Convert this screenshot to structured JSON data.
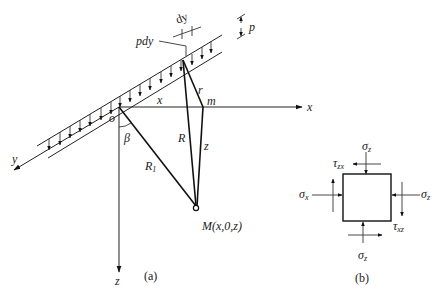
{
  "figure": {
    "panel_a": {
      "caption": "(a)",
      "axes": {
        "x": "x",
        "y": "y",
        "z": "z"
      },
      "origin_label": "o",
      "point_m_label": "m",
      "point_M_label": "M(x,0,z)",
      "segment_x_label": "x",
      "segment_r_label": "r",
      "segment_R_label": "R",
      "segment_R1_label": "R",
      "segment_R1_sub": "1",
      "segment_z_label": "z",
      "angle_label": "β",
      "load_element_label": "pdy",
      "width_label": "dy",
      "load_intensity_label": "p"
    },
    "panel_b": {
      "caption": "(b)",
      "top_normal": "σ",
      "top_normal_sub": "z",
      "bottom_normal": "σ",
      "bottom_normal_sub": "z",
      "left_normal": "σ",
      "left_normal_sub": "x",
      "right_normal": "σ",
      "right_normal_sub": "z",
      "top_shear": "τ",
      "top_shear_sub": "zx",
      "right_shear": "τ",
      "right_shear_sub": "xz"
    }
  }
}
